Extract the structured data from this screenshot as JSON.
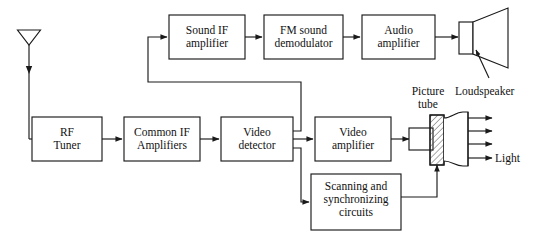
{
  "diagram": {
    "stroke_color": "#1a1a1a",
    "background_color": "#ffffff",
    "hatch_color": "#555555",
    "blocks": [
      {
        "id": "sound-if-amplifier",
        "label": "Sound IF\namplifier",
        "x": 169,
        "y": 15,
        "w": 76,
        "h": 44
      },
      {
        "id": "fm-sound-demodulator",
        "label": "FM sound\ndemodulator",
        "x": 264,
        "y": 15,
        "w": 79,
        "h": 44
      },
      {
        "id": "audio-amplifier",
        "label": "Audio\namplifier",
        "x": 362,
        "y": 15,
        "w": 73,
        "h": 44
      },
      {
        "id": "rf-tuner",
        "label": "RF\nTuner",
        "x": 32,
        "y": 117,
        "w": 70,
        "h": 44
      },
      {
        "id": "common-if-amplifiers",
        "label": "Common IF\nAmplifiers",
        "x": 124,
        "y": 117,
        "w": 76,
        "h": 44
      },
      {
        "id": "video-detector",
        "label": "Video\ndetector",
        "x": 221,
        "y": 117,
        "w": 72,
        "h": 44
      },
      {
        "id": "video-amplifier",
        "label": "Video\namplifier",
        "x": 315,
        "y": 117,
        "w": 76,
        "h": 44
      },
      {
        "id": "scanning-sync",
        "label": "Scanning and\nsynchronizing\ncircuits",
        "x": 311,
        "y": 174,
        "w": 90,
        "h": 56
      }
    ],
    "annotations": [
      {
        "id": "picture-tube",
        "label": "Picture\ntube",
        "x": 408,
        "y": 85
      },
      {
        "id": "loudspeaker",
        "label": "Loudspeaker",
        "x": 466,
        "y": 85
      },
      {
        "id": "light",
        "label": "Light",
        "x": 493,
        "y": 158
      }
    ],
    "icons": [
      {
        "id": "antenna-icon",
        "description": "receiving antenna, downward triangle on mast"
      },
      {
        "id": "loudspeaker-icon",
        "description": "cone loudspeaker, rectangle with trapezoid horn"
      },
      {
        "id": "picture-tube-icon",
        "description": "cathode ray tube, neck with hatched yoke and bell flare screen"
      },
      {
        "id": "light-rays-icon",
        "description": "four arrows emitted from tube screen face"
      }
    ]
  }
}
